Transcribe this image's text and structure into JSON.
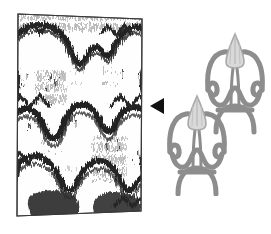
{
  "figure": {
    "background_color": "#ffffff",
    "width": 271,
    "height": 234
  },
  "textile": {
    "label": "ikat-textile-photograph",
    "description": "Monochrome photograph of a woven ikat cloth showing blurred-edge repeating arch motifs",
    "frame_color": "#3b3b3b",
    "cloth_color": "#ffffff",
    "pattern_color": "#2b2b2b",
    "bounds": {
      "x": 14,
      "y": 11,
      "width": 132,
      "height": 208
    },
    "repeat_rows": 3,
    "repeat_columns": 2
  },
  "marker": {
    "label": "left-pointing-triangle",
    "icon": "triangle-left-icon",
    "color": "#111111",
    "bounds": {
      "x": 148,
      "y": 96,
      "width": 20,
      "height": 20
    }
  },
  "schematic": {
    "label": "motif-line-drawing",
    "description": "Two offset tulip-like motifs drawn as thick grey strokes with pointed flame heads",
    "stroke_color": "#8d8d8d",
    "head_fill_color": "#d9d9d9",
    "head_outline_color": "#a9a9a9",
    "stroke_width": 5,
    "bounds": {
      "x": 166,
      "y": 28,
      "width": 100,
      "height": 168
    },
    "motif_count": 2,
    "motifs": [
      {
        "name": "upper-right-motif",
        "offset_x": 38,
        "offset_y": 0
      },
      {
        "name": "lower-left-motif",
        "offset_x": 0,
        "offset_y": 62
      }
    ]
  }
}
